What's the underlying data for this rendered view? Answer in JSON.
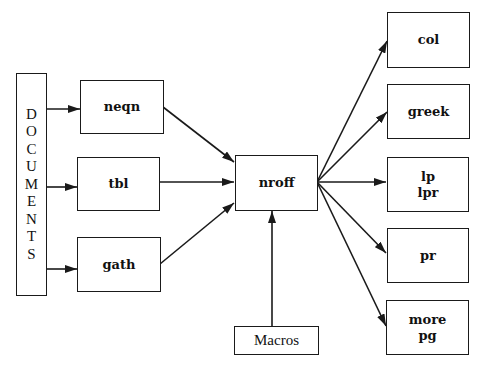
{
  "diagram": {
    "type": "flowchart",
    "title": "",
    "source": {
      "label": "DOCUMENTS",
      "letters": [
        "D",
        "O",
        "C",
        "U",
        "M",
        "E",
        "N",
        "T",
        "S"
      ]
    },
    "preprocessors": [
      {
        "id": "neqn",
        "label": "neqn"
      },
      {
        "id": "tbl",
        "label": "tbl"
      },
      {
        "id": "gath",
        "label": "gath"
      }
    ],
    "formatter": {
      "id": "nroff",
      "label": "nroff"
    },
    "macros": {
      "id": "macros",
      "label": "Macros"
    },
    "outputs": [
      {
        "id": "col",
        "lines": [
          "col"
        ]
      },
      {
        "id": "greek",
        "lines": [
          "greek"
        ]
      },
      {
        "id": "lp",
        "lines": [
          "lp",
          "lpr"
        ]
      },
      {
        "id": "pr",
        "lines": [
          "pr"
        ]
      },
      {
        "id": "more",
        "lines": [
          "more",
          "pg"
        ]
      }
    ],
    "edges": [
      {
        "from": "DOCUMENTS",
        "to": "neqn"
      },
      {
        "from": "DOCUMENTS",
        "to": "tbl"
      },
      {
        "from": "DOCUMENTS",
        "to": "gath"
      },
      {
        "from": "neqn",
        "to": "nroff"
      },
      {
        "from": "tbl",
        "to": "nroff"
      },
      {
        "from": "gath",
        "to": "nroff"
      },
      {
        "from": "Macros",
        "to": "nroff"
      },
      {
        "from": "nroff",
        "to": "col"
      },
      {
        "from": "nroff",
        "to": "greek"
      },
      {
        "from": "nroff",
        "to": "lp/lpr"
      },
      {
        "from": "nroff",
        "to": "pr"
      },
      {
        "from": "nroff",
        "to": "more/pg"
      }
    ],
    "colors": {
      "stroke": "#1a1a1a",
      "background": "#ffffff",
      "text": "#111111"
    }
  }
}
